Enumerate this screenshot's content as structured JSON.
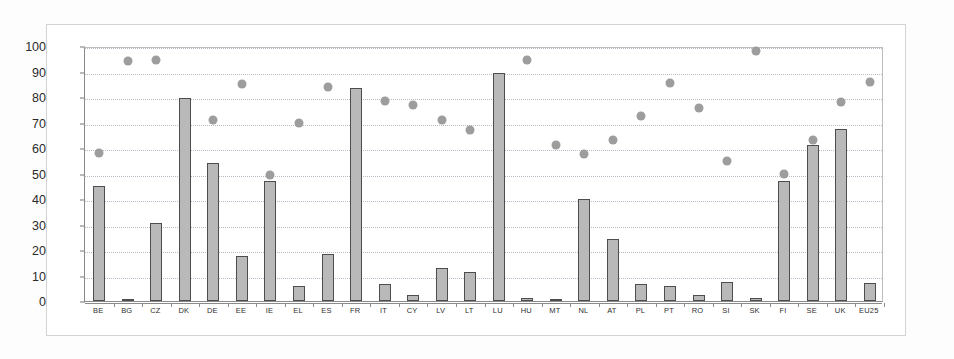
{
  "chart_data": {
    "type": "bar",
    "title": "",
    "subtitle": "",
    "xlabel": "",
    "ylabel": "",
    "ylim": [
      0,
      100
    ],
    "yticks": [
      0,
      10,
      20,
      30,
      40,
      50,
      60,
      70,
      80,
      90,
      100
    ],
    "grid": true,
    "legend": "none",
    "categories": [
      "BE",
      "BG",
      "CZ",
      "DK",
      "DE",
      "EE",
      "IE",
      "EL",
      "ES",
      "FR",
      "IT",
      "CY",
      "LV",
      "LT",
      "LU",
      "HU",
      "MT",
      "NL",
      "AT",
      "PL",
      "PT",
      "RO",
      "SI",
      "SK",
      "FI",
      "SE",
      "UK",
      "EU25"
    ],
    "series": [
      {
        "name": "bars",
        "marker": "bar",
        "values": [
          45,
          0.5,
          30.5,
          79.5,
          54,
          17.5,
          47,
          6,
          18.5,
          83.5,
          6.5,
          2.5,
          13,
          11.5,
          89.5,
          1,
          0.5,
          40,
          24.5,
          6.5,
          6,
          2.5,
          7.5,
          1,
          47,
          61,
          67.5,
          7
        ]
      },
      {
        "name": "dots",
        "marker": "circle",
        "values": [
          58,
          94,
          94.5,
          null,
          71,
          85,
          49.5,
          70,
          84,
          null,
          78.5,
          77,
          71,
          67,
          null,
          94.5,
          61,
          57.5,
          63,
          72.5,
          85.5,
          75.5,
          55,
          98,
          50,
          63,
          78,
          86
        ]
      }
    ]
  },
  "axis": {
    "y_tick_labels": [
      "0",
      "10",
      "20",
      "30",
      "40",
      "50",
      "60",
      "70",
      "80",
      "90",
      "100"
    ]
  }
}
